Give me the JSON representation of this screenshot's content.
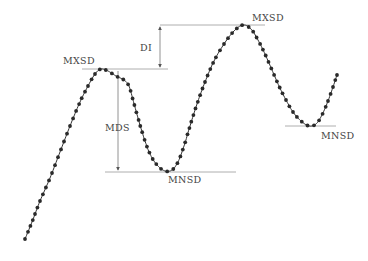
{
  "diagram": {
    "labels": {
      "peak1": "MXSD",
      "peak2": "MXSD",
      "trough1": "MNSD",
      "trough2": "MNSD",
      "di": "DI",
      "mds": "MDS"
    },
    "curve_description": "Dotted signal curve rising to a first local maximum (MXSD), descending to a local minimum (MNSD), rising to a higher maximum (MXSD), descending to a second minimum (MNSD), then rising again. DI marks vertical difference between the two maxima; MDS marks the drop from first maximum to first minimum.",
    "colors": {
      "curve": "#333333",
      "points": "#2a2a2a",
      "reference_lines": "#9a9a9a",
      "text": "#444444"
    }
  }
}
